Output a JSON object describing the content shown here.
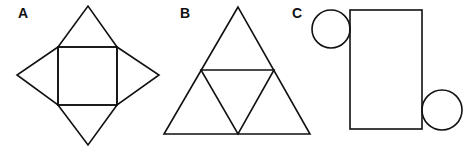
{
  "figures": [
    {
      "label": "A",
      "description": "Square pyramid net: square with four triangles",
      "label_pos": [
        18,
        18
      ],
      "square": {
        "x": 58,
        "y": 47,
        "w": 59,
        "h": 58
      },
      "apexes": {
        "top": [
          88,
          6
        ],
        "left": [
          17,
          75
        ],
        "right": [
          159,
          75
        ],
        "bottom": [
          88,
          145
        ]
      }
    },
    {
      "label": "B",
      "description": "Tetrahedron net: large triangle subdivided into four triangles",
      "label_pos": [
        180,
        18
      ],
      "outer": {
        "apex": [
          238,
          7
        ],
        "base_left": [
          164,
          134
        ],
        "base_right": [
          310,
          134
        ]
      },
      "midpoints": {
        "left": [
          201,
          70
        ],
        "right": [
          274,
          70
        ],
        "bottom": [
          238,
          134
        ]
      }
    },
    {
      "label": "C",
      "description": "Cylinder net: rectangle with two circles",
      "label_pos": [
        292,
        18
      ],
      "rect": {
        "x": 350,
        "y": 10,
        "w": 72,
        "h": 119
      },
      "circles": [
        {
          "cx": 331,
          "cy": 29,
          "r": 19
        },
        {
          "cx": 442,
          "cy": 110,
          "r": 20
        }
      ]
    }
  ]
}
